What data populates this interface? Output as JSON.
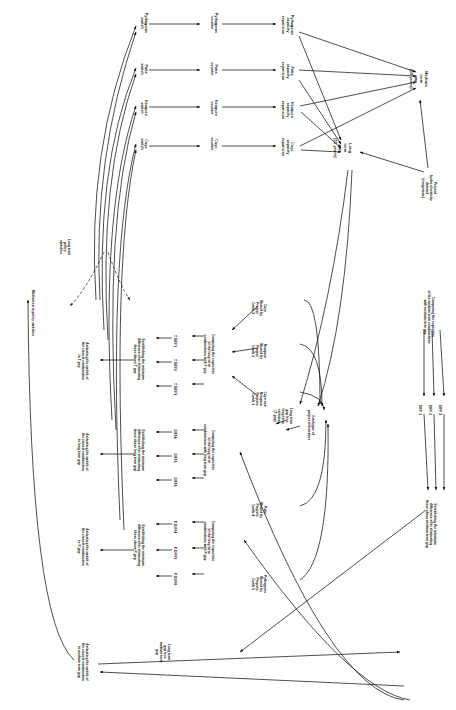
{
  "diagram": {
    "orientation": "text rotated 90 degrees clockwise (landscape figure printed on a portrait page)",
    "type": "flowchart",
    "stroke_color": "#141414",
    "background_color": "#ffffff",
    "nodes": [
      {
        "id": "n1",
        "label": "Pythagoras\nswitch",
        "x": 140,
        "y": 12,
        "w": 34
      },
      {
        "id": "n2",
        "label": "Pythagoras\ncounter",
        "x": 212,
        "y": 12,
        "w": 34
      },
      {
        "id": "n3",
        "label": "Pythagoras\ncapacity\nexpansion",
        "x": 288,
        "y": 10,
        "w": 40
      },
      {
        "id": "n4",
        "label": "Patia\nswitch",
        "x": 140,
        "y": 60,
        "w": 30
      },
      {
        "id": "n5",
        "label": "Patia\ncounter",
        "x": 212,
        "y": 60,
        "w": 30
      },
      {
        "id": "n6",
        "label": "Patia\ncapacity\nexpansion",
        "x": 288,
        "y": 58,
        "w": 36
      },
      {
        "id": "n7",
        "label": "Neuquen\nswitch",
        "x": 140,
        "y": 96,
        "w": 32
      },
      {
        "id": "n8",
        "label": "Neuquen\ncounter",
        "x": 212,
        "y": 96,
        "w": 32
      },
      {
        "id": "n9",
        "label": "Neuquen\ncapacity\nexpansion",
        "x": 288,
        "y": 94,
        "w": 38
      },
      {
        "id": "n10",
        "label": "Cuyo\nswitch",
        "x": 140,
        "y": 134,
        "w": 28
      },
      {
        "id": "n11",
        "label": "Cuyo\ncounter",
        "x": 212,
        "y": 134,
        "w": 28
      },
      {
        "id": "n12",
        "label": "Cuyo\ncapacity\nexpansion",
        "x": 288,
        "y": 132,
        "w": 36
      },
      {
        "id": "n13",
        "label": "Long\nterm\ngap\n(15 years)",
        "x": 348,
        "y": 130,
        "w": 40
      },
      {
        "id": "n14",
        "label": "Medium\nterm\ngap\n(10 years)",
        "x": 424,
        "y": 60,
        "w": 42
      },
      {
        "id": "n15",
        "label": "Present\nhydro-electricity\ndemand\n(exogenous)",
        "x": 432,
        "y": 168,
        "w": 46
      },
      {
        "id": "n16",
        "label": "Comparing the capacities\nof the medium term combinations\nwith medium term gap",
        "x": 430,
        "y": 288,
        "w": 66
      },
      {
        "id": "n17",
        "label": "DIFF 1",
        "x": 427,
        "y": 402,
        "w": 18
      },
      {
        "id": "n18",
        "label": "DIFF 2",
        "x": 437,
        "y": 402,
        "w": 18
      },
      {
        "id": "n19",
        "label": "DIFF 3",
        "x": 447,
        "y": 402,
        "w": 18
      },
      {
        "id": "n20",
        "label": "Establishing the minimum\ndifference after eliminating\nthose above medium term gap",
        "x": 432,
        "y": 496,
        "w": 64
      },
      {
        "id": "n21",
        "label": "Cuyo\nShared by\nProject\nComb 3",
        "x": 262,
        "y": 296,
        "w": 30
      },
      {
        "id": "n22",
        "label": "Neuquen\nShared by\nProject\nComb 2",
        "x": 262,
        "y": 338,
        "w": 32
      },
      {
        "id": "n23",
        "label": "Cuyo and\nNeuquen\nProjects\nComb 1",
        "x": 262,
        "y": 386,
        "w": 32
      },
      {
        "id": "n24",
        "label": "Catalogue of\nproject alternatives",
        "x": 310,
        "y": 410,
        "w": 38
      },
      {
        "id": "n25",
        "label": "Long term\ngap less\nlong term\nselection\n(T gap)",
        "x": 288,
        "y": 402,
        "w": 34
      },
      {
        "id": "n26",
        "label": "Comparing the capacities\nof the long term\ncombinations with T gap",
        "x": 210,
        "y": 330,
        "w": 56
      },
      {
        "id": "n27",
        "label": "T DIFF1",
        "x": 180,
        "y": 332,
        "w": 20
      },
      {
        "id": "n28",
        "label": "T DIFF2",
        "x": 180,
        "y": 356,
        "w": 20
      },
      {
        "id": "n29",
        "label": "T DIFF3",
        "x": 180,
        "y": 380,
        "w": 20
      },
      {
        "id": "n30",
        "label": "Establishing the minimum\ndifference after eliminating\nthose above T gap",
        "x": 140,
        "y": 334,
        "w": 58
      },
      {
        "id": "n31",
        "label": "Activating the switch of\nthe closest combination\nto T gap",
        "x": 84,
        "y": 340,
        "w": 50
      },
      {
        "id": "n32",
        "label": "Comparing the capacities\nof the long term\ncombinations with long term gap",
        "x": 210,
        "y": 424,
        "w": 60
      },
      {
        "id": "n33",
        "label": "DIFF4",
        "x": 180,
        "y": 426,
        "w": 18
      },
      {
        "id": "n34",
        "label": "DIFF5",
        "x": 180,
        "y": 450,
        "w": 18
      },
      {
        "id": "n35",
        "label": "DIFF6",
        "x": 180,
        "y": 474,
        "w": 18
      },
      {
        "id": "n36",
        "label": "Establishing the minimum\ndifference after eliminating\nthose above long term gap",
        "x": 140,
        "y": 424,
        "w": 60
      },
      {
        "id": "n37",
        "label": "Activating the switch of\nthe closest combination\nto long term gap",
        "x": 84,
        "y": 430,
        "w": 52
      },
      {
        "id": "n38",
        "label": "Pythagoras\nShared by\nProjects\nComb 5",
        "x": 262,
        "y": 572,
        "w": 30
      },
      {
        "id": "n39",
        "label": "Patia\nShared by\nProjects\nComb 4",
        "x": 262,
        "y": 498,
        "w": 30
      },
      {
        "id": "n40",
        "label": "Comparing the capacities\nof the long term\ncombinations with P-gap",
        "x": 210,
        "y": 516,
        "w": 58
      },
      {
        "id": "n41",
        "label": "P-DIFF4",
        "x": 180,
        "y": 518,
        "w": 20
      },
      {
        "id": "n42",
        "label": "P-DIFF5",
        "x": 180,
        "y": 544,
        "w": 20
      },
      {
        "id": "n43",
        "label": "P-DIFF6",
        "x": 180,
        "y": 570,
        "w": 20
      },
      {
        "id": "n44",
        "label": "Establishing the minimum\ndifference after eliminating\nthose above P-gap",
        "x": 140,
        "y": 520,
        "w": 58
      },
      {
        "id": "n45",
        "label": "Activating the switch of\nthe closest combination\nto P-gap",
        "x": 84,
        "y": 526,
        "w": 50
      },
      {
        "id": "n46",
        "label": "Activating the switch of\nthe closest combination\nto medium term gap",
        "x": 84,
        "y": 640,
        "w": 52
      },
      {
        "id": "n47",
        "label": "Long term\ngap less\nmedium term\ngap",
        "x": 166,
        "y": 636,
        "w": 36
      },
      {
        "id": "n48",
        "label": "Long term\npolicy\nswitches",
        "x": 66,
        "y": 236,
        "w": 28
      },
      {
        "id": "n49",
        "label": "Medium term policy switches",
        "x": 30,
        "y": 286,
        "w": 58
      }
    ]
  }
}
